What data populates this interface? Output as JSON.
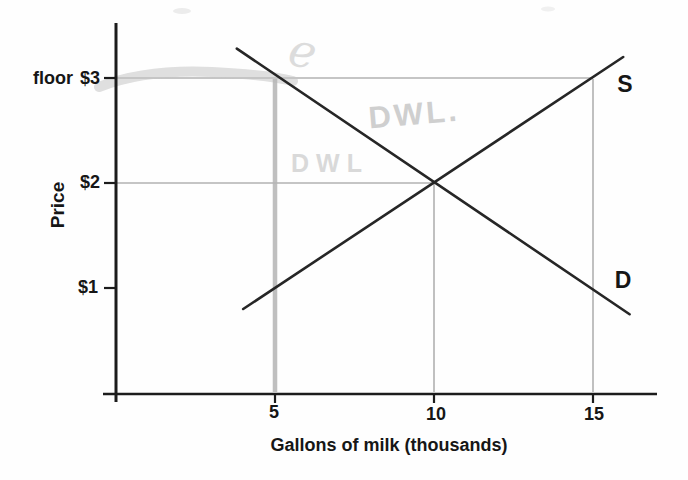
{
  "figure": {
    "kind": "supply-demand diagram with price floor (scanned textbook figure)",
    "background": "#fefefe"
  },
  "labels": {
    "floor_word": "floor",
    "price_3": "$3",
    "price_2": "$2",
    "price_1": "$1",
    "y_axis_title": "Price",
    "x_axis_title": "Gallons of milk (thousands)",
    "qty_5": "5",
    "qty_10": "10",
    "qty_15": "15",
    "supply": "S",
    "demand": "D"
  },
  "annotations": {
    "e": "e",
    "dwl_upper": "DWL.",
    "dwl_lower": "DWL"
  },
  "colors": {
    "curve_line": "#262626",
    "axis_line": "#1c1c1c",
    "gridline": "#8c8c8c",
    "highlighter": "#c5c5c5",
    "vertical_marker": "#b5b5b5",
    "text": "#161616",
    "handwriting": "#d2d2d2"
  },
  "chart_data": {
    "type": "line",
    "title": "",
    "xlabel": "Gallons of milk (thousands)",
    "ylabel": "Price",
    "x_ticks": [
      5,
      10,
      15
    ],
    "y_tick_values": [
      1,
      2,
      3
    ],
    "y_tick_labels": [
      "$1",
      "$2",
      "$3"
    ],
    "xlim": [
      0,
      17.4
    ],
    "ylim": [
      0,
      3.55
    ],
    "grid": false,
    "legend": "inline curve labels S and D",
    "series": [
      {
        "name": "S",
        "role": "supply",
        "x": [
          4.0,
          15.95
        ],
        "y": [
          0.8,
          3.2
        ],
        "passes_through": [
          [
            5,
            1
          ],
          [
            10,
            2
          ],
          [
            15,
            3
          ]
        ]
      },
      {
        "name": "D",
        "role": "demand",
        "x": [
          3.8,
          16.15
        ],
        "y": [
          3.28,
          0.75
        ],
        "passes_through": [
          [
            5,
            3
          ],
          [
            10,
            2
          ],
          [
            15,
            1
          ]
        ]
      }
    ],
    "equilibrium": {
      "quantity": 10,
      "price": 2
    },
    "price_floor": {
      "label": "floor",
      "price": 3,
      "quantity_demanded": 5,
      "quantity_supplied": 15,
      "highlighted_with_gray_marker": true
    },
    "reference_lines": {
      "horizontal": [
        {
          "price": 3,
          "from_q": 0,
          "to_q": 15
        },
        {
          "price": 2,
          "from_q": 0,
          "to_q": 10
        }
      ],
      "vertical": [
        {
          "quantity": 5,
          "from_p": 0,
          "to_p": 3,
          "style": "gray-marker"
        },
        {
          "quantity": 10,
          "from_p": 0,
          "to_p": 2,
          "style": "thin"
        },
        {
          "quantity": 15,
          "from_p": 0,
          "to_p": 3,
          "style": "thin"
        }
      ]
    },
    "handwritten_annotations": [
      {
        "text": "e",
        "position": "above demand curve at the price floor"
      },
      {
        "text": "DWL.",
        "position": "upper wedge between D and S, right of q=5"
      },
      {
        "text": "DWL",
        "position": "just above $2 gridline, left of equilibrium"
      }
    ]
  }
}
